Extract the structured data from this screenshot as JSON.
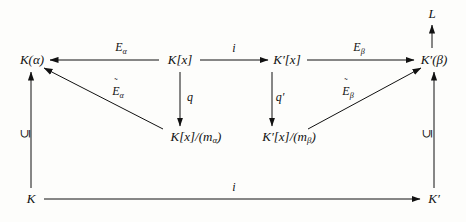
{
  "diagram": {
    "type": "commutative-diagram",
    "background_color": "#fdfdfb",
    "ink_color": "#111111",
    "nodes": [
      {
        "id": "L",
        "label": "L",
        "x": 432,
        "y": 14
      },
      {
        "id": "Kalpha",
        "label": "K(α)",
        "x": 32,
        "y": 60
      },
      {
        "id": "Kx",
        "label": "K[x]",
        "x": 180,
        "y": 60
      },
      {
        "id": "Kpx",
        "label": "K′[x]",
        "x": 287,
        "y": 60
      },
      {
        "id": "Kpbeta",
        "label": "K′(β)",
        "x": 434,
        "y": 60
      },
      {
        "id": "Kxquot",
        "label": "K[x]/(m",
        "sub": "α",
        "suffix": ")",
        "x": 196,
        "y": 137
      },
      {
        "id": "Kpxquot",
        "label": "K′[x]/(m",
        "sub": "β",
        "suffix": ")",
        "x": 289,
        "y": 137
      },
      {
        "id": "K",
        "label": "K",
        "x": 31,
        "y": 199
      },
      {
        "id": "Kprime",
        "label": "K′",
        "x": 434,
        "y": 199
      }
    ],
    "edge_labels": [
      {
        "id": "E-alpha",
        "base": "E",
        "sub": "α",
        "tilde": false,
        "x": 121,
        "y": 48
      },
      {
        "id": "i-top",
        "base": "i",
        "sub": "",
        "tilde": false,
        "x": 234,
        "y": 48
      },
      {
        "id": "E-beta",
        "base": "E",
        "sub": "β",
        "tilde": false,
        "x": 359,
        "y": 48
      },
      {
        "id": "E-tilde-alpha",
        "base": "E",
        "sub": "α",
        "tilde": true,
        "x": 118,
        "y": 92
      },
      {
        "id": "q",
        "base": "q",
        "sub": "",
        "tilde": false,
        "x": 190,
        "y": 97
      },
      {
        "id": "q-prime",
        "base": "q′",
        "sub": "",
        "tilde": false,
        "x": 280,
        "y": 97
      },
      {
        "id": "E-tilde-beta",
        "base": "E",
        "sub": "β",
        "tilde": true,
        "x": 348,
        "y": 92
      },
      {
        "id": "i-bottom",
        "base": "i",
        "sub": "",
        "tilde": false,
        "x": 234,
        "y": 187
      }
    ],
    "inclusion_labels": [
      {
        "id": "incl-left",
        "glyph": "⊆",
        "x": 25,
        "y": 134
      },
      {
        "id": "incl-right",
        "glyph": "⊆",
        "x": 427,
        "y": 134
      }
    ],
    "arrows": [
      {
        "id": "arrow-Kx-to-Kalpha",
        "from": "Kx",
        "to": "Kalpha",
        "x1": 159,
        "y1": 60,
        "x2": 50,
        "y2": 60,
        "head": "end"
      },
      {
        "id": "arrow-Kx-to-Kpx",
        "from": "Kx",
        "to": "Kpx",
        "x1": 200,
        "y1": 60,
        "x2": 268,
        "y2": 60,
        "head": "end"
      },
      {
        "id": "arrow-Kpx-to-Kpbeta",
        "from": "Kpx",
        "to": "Kpbeta",
        "x1": 307,
        "y1": 60,
        "x2": 414,
        "y2": 60,
        "head": "end"
      },
      {
        "id": "arrow-Kpbeta-to-L",
        "from": "Kpbeta",
        "to": "L",
        "x1": 432,
        "y1": 48,
        "x2": 432,
        "y2": 25,
        "head": "end"
      },
      {
        "id": "arrow-Kx-to-Kxquot",
        "from": "Kx",
        "to": "Kxquot",
        "x1": 180,
        "y1": 72,
        "x2": 180,
        "y2": 126,
        "head": "end"
      },
      {
        "id": "arrow-Kpx-to-Kpxquot",
        "from": "Kpx",
        "to": "Kpxquot",
        "x1": 272,
        "y1": 72,
        "x2": 272,
        "y2": 126,
        "head": "end"
      },
      {
        "id": "arrow-Kxquot-to-Kalpha",
        "from": "Kxquot",
        "to": "Kalpha",
        "x1": 163,
        "y1": 129,
        "x2": 44,
        "y2": 68,
        "head": "end"
      },
      {
        "id": "arrow-Kpxquot-to-Kpbeta",
        "from": "Kpxquot",
        "to": "Kpbeta",
        "x1": 308,
        "y1": 129,
        "x2": 421,
        "y2": 68,
        "head": "end"
      },
      {
        "id": "arrow-K-to-Kalpha",
        "from": "K",
        "to": "Kalpha",
        "x1": 31,
        "y1": 188,
        "x2": 31,
        "y2": 72,
        "head": "end"
      },
      {
        "id": "arrow-Kprime-to-Kpbeta",
        "from": "Kprime",
        "to": "Kpbeta",
        "x1": 434,
        "y1": 188,
        "x2": 434,
        "y2": 72,
        "head": "end"
      },
      {
        "id": "arrow-K-to-Kprime",
        "from": "K",
        "to": "Kprime",
        "x1": 44,
        "y1": 199,
        "x2": 420,
        "y2": 199,
        "head": "end"
      }
    ]
  }
}
